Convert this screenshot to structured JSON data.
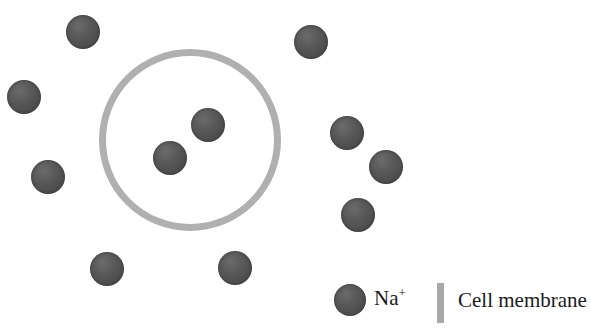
{
  "diagram": {
    "background_color": "#ffffff",
    "ion_color": "#555555",
    "membrane_color": "#b0b0b0"
  },
  "membrane": {
    "shape": "circle",
    "center_x": 190,
    "center_y": 140,
    "radius": 90,
    "stroke_width": 7,
    "color": "#b0b0b0"
  },
  "ions": [
    {
      "id": "ion-inside-1",
      "location": "inside",
      "x": 208,
      "y": 125,
      "diameter": 34
    },
    {
      "id": "ion-inside-2",
      "location": "inside",
      "x": 170,
      "y": 158,
      "diameter": 34
    },
    {
      "id": "ion-outside-1",
      "location": "outside",
      "x": 83,
      "y": 32,
      "diameter": 34
    },
    {
      "id": "ion-outside-2",
      "location": "outside",
      "x": 24,
      "y": 97,
      "diameter": 34
    },
    {
      "id": "ion-outside-3",
      "location": "outside",
      "x": 48,
      "y": 177,
      "diameter": 34
    },
    {
      "id": "ion-outside-4",
      "location": "outside",
      "x": 107,
      "y": 269,
      "diameter": 34
    },
    {
      "id": "ion-outside-5",
      "location": "outside",
      "x": 235,
      "y": 268,
      "diameter": 34
    },
    {
      "id": "ion-outside-6",
      "location": "outside",
      "x": 311,
      "y": 42,
      "diameter": 34
    },
    {
      "id": "ion-outside-7",
      "location": "outside",
      "x": 347,
      "y": 133,
      "diameter": 34
    },
    {
      "id": "ion-outside-8",
      "location": "outside",
      "x": 386,
      "y": 167,
      "diameter": 34
    },
    {
      "id": "ion-outside-9",
      "location": "outside",
      "x": 358,
      "y": 215,
      "diameter": 34
    }
  ],
  "legend": {
    "ion": {
      "symbol_base": "Na",
      "symbol_charge": "+",
      "swatch": "ion-circle-swatch"
    },
    "membrane": {
      "label": "Cell membrane",
      "swatch": "membrane-bar-swatch"
    }
  }
}
